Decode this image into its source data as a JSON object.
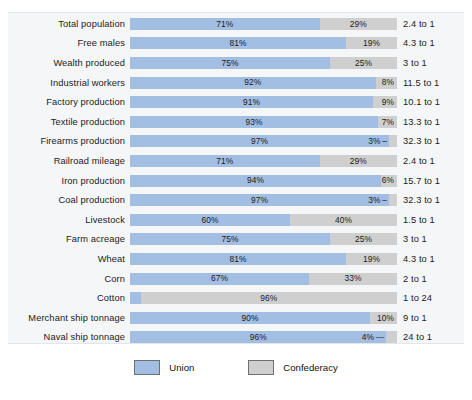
{
  "chart_data": {
    "type": "bar",
    "title": "",
    "subtitle": "",
    "xlabel": "",
    "ylabel": "",
    "orientation": "horizontal",
    "stacked": true,
    "normalized": true,
    "xlim": [
      0,
      100
    ],
    "grid": false,
    "legend_position": "bottom-center",
    "categories": [
      "Total population",
      "Free males",
      "Wealth produced",
      "Industrial workers",
      "Factory production",
      "Textile production",
      "Firearms production",
      "Railroad mileage",
      "Iron production",
      "Coal production",
      "Livestock",
      "Farm acreage",
      "Wheat",
      "Corn",
      "Cotton",
      "Merchant ship tonnage",
      "Naval ship tonnage"
    ],
    "series": [
      {
        "name": "Union",
        "color": "#a2bee3",
        "values": [
          71,
          81,
          75,
          92,
          91,
          93,
          97,
          71,
          94,
          97,
          60,
          75,
          81,
          67,
          4,
          90,
          96
        ]
      },
      {
        "name": "Confederacy",
        "color": "#cfcfcf",
        "values": [
          29,
          19,
          25,
          8,
          9,
          7,
          3,
          29,
          6,
          3,
          40,
          25,
          19,
          33,
          96,
          10,
          4
        ]
      }
    ],
    "annotations": {
      "ratio_column_header": "",
      "ratios": [
        "2.4 to 1",
        "4.3 to 1",
        "3 to 1",
        "11.5 to 1",
        "10.1 to 1",
        "13.3 to 1",
        "32.3 to 1",
        "2.4 to 1",
        "15.7 to 1",
        "32.3 to 1",
        "1.5 to 1",
        "3 to 1",
        "4.3 to 1",
        "2 to 1",
        "1 to 24",
        "9 to 1",
        "24 to 1"
      ]
    }
  },
  "rows": [
    {
      "label": "Total population",
      "union": 71,
      "confederacy": 29,
      "union_text": "71%",
      "confederacy_text": "29%",
      "union_placement": "inside-center",
      "confederacy_placement": "inside-center",
      "ratio": "2.4 to 1"
    },
    {
      "label": "Free males",
      "union": 81,
      "confederacy": 19,
      "union_text": "81%",
      "confederacy_text": "19%",
      "union_placement": "inside-center",
      "confederacy_placement": "inside-center",
      "ratio": "4.3 to 1"
    },
    {
      "label": "Wealth produced",
      "union": 75,
      "confederacy": 25,
      "union_text": "75%",
      "confederacy_text": "25%",
      "union_placement": "inside-center",
      "confederacy_placement": "inside-center",
      "ratio": "3 to 1"
    },
    {
      "label": "Industrial workers",
      "union": 92,
      "confederacy": 8,
      "union_text": "92%",
      "confederacy_text": "8%",
      "union_placement": "inside-center",
      "confederacy_placement": "inside-right",
      "ratio": "11.5 to 1"
    },
    {
      "label": "Factory production",
      "union": 91,
      "confederacy": 9,
      "union_text": "91%",
      "confederacy_text": "9%",
      "union_placement": "inside-center",
      "confederacy_placement": "inside-right",
      "ratio": "10.1 to 1"
    },
    {
      "label": "Textile production",
      "union": 93,
      "confederacy": 7,
      "union_text": "93%",
      "confederacy_text": "7%",
      "union_placement": "inside-center",
      "confederacy_placement": "inside-right",
      "ratio": "13.3 to 1"
    },
    {
      "label": "Firearms production",
      "union": 97,
      "confederacy": 3,
      "union_text": "97%",
      "confederacy_text": "3% –",
      "union_placement": "inside-center",
      "confederacy_placement": "outside-left-leader",
      "ratio": "32.3 to 1"
    },
    {
      "label": "Railroad mileage",
      "union": 71,
      "confederacy": 29,
      "union_text": "71%",
      "confederacy_text": "29%",
      "union_placement": "inside-center",
      "confederacy_placement": "inside-center",
      "ratio": "2.4 to 1"
    },
    {
      "label": "Iron production",
      "union": 94,
      "confederacy": 6,
      "union_text": "94%",
      "confederacy_text": "6%",
      "union_placement": "inside-center",
      "confederacy_placement": "inside-right",
      "ratio": "15.7 to 1"
    },
    {
      "label": "Coal production",
      "union": 97,
      "confederacy": 3,
      "union_text": "97%",
      "confederacy_text": "3% –",
      "union_placement": "inside-center",
      "confederacy_placement": "outside-left-leader",
      "ratio": "32.3 to 1"
    },
    {
      "label": "Livestock",
      "union": 60,
      "confederacy": 40,
      "union_text": "60%",
      "confederacy_text": "40%",
      "union_placement": "inside-center",
      "confederacy_placement": "inside-center",
      "ratio": "1.5 to 1"
    },
    {
      "label": "Farm acreage",
      "union": 75,
      "confederacy": 25,
      "union_text": "75%",
      "confederacy_text": "25%",
      "union_placement": "inside-center",
      "confederacy_placement": "inside-center",
      "ratio": "3 to 1"
    },
    {
      "label": "Wheat",
      "union": 81,
      "confederacy": 19,
      "union_text": "81%",
      "confederacy_text": "19%",
      "union_placement": "inside-center",
      "confederacy_placement": "inside-center",
      "ratio": "4.3 to 1"
    },
    {
      "label": "Corn",
      "union": 67,
      "confederacy": 33,
      "union_text": "67%",
      "confederacy_text": "33%",
      "union_placement": "inside-center",
      "confederacy_placement": "inside-center",
      "ratio": "2 to 1"
    },
    {
      "label": "Cotton",
      "union": 4,
      "confederacy": 96,
      "union_text": "– 4%",
      "confederacy_text": "96%",
      "union_placement": "outside-right-leader",
      "confederacy_placement": "inside-center",
      "ratio": "1 to 24"
    },
    {
      "label": "Merchant ship tonnage",
      "union": 90,
      "confederacy": 10,
      "union_text": "90%",
      "confederacy_text": "10%",
      "union_placement": "inside-center",
      "confederacy_placement": "inside-right",
      "ratio": "9 to 1"
    },
    {
      "label": "Naval ship tonnage",
      "union": 96,
      "confederacy": 4,
      "union_text": "96%",
      "confederacy_text": "4% —",
      "union_placement": "inside-center",
      "confederacy_placement": "outside-left-leader",
      "ratio": "24 to 1"
    }
  ],
  "legend": {
    "items": [
      {
        "label": "Union",
        "color": "#a2bee3"
      },
      {
        "label": "Confederacy",
        "color": "#cfcfcf"
      }
    ]
  }
}
